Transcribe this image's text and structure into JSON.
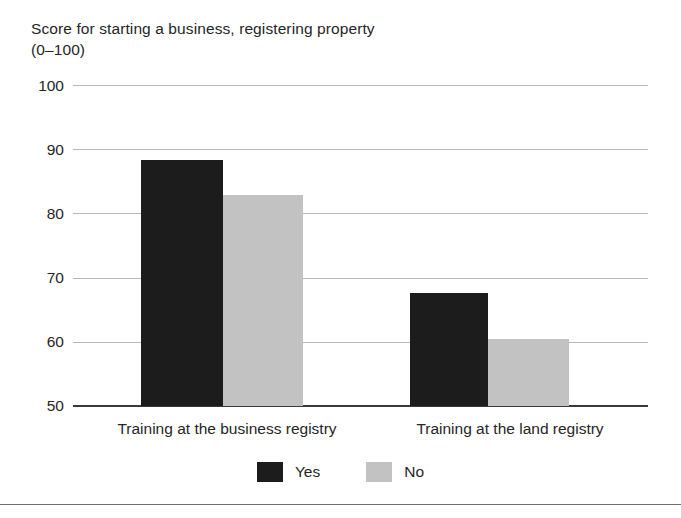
{
  "chart_data": {
    "type": "bar",
    "title_line1": "Score for starting a business, registering property",
    "title_line2": "(0–100)",
    "xlabel": "",
    "ylabel": "",
    "ylim": [
      50,
      100
    ],
    "yticks": [
      50,
      60,
      70,
      80,
      90,
      100
    ],
    "ytick_labels": [
      "50",
      "60",
      "70",
      "80",
      "90",
      "100"
    ],
    "grid": true,
    "grid_axis": "y",
    "legend_position": "bottom-center",
    "categories": [
      "Training at the business registry",
      "Training at the land registry"
    ],
    "series": [
      {
        "name": "Yes",
        "color": "#1c1c1c",
        "values": [
          88.3,
          67.6
        ]
      },
      {
        "name": "No",
        "color": "#c2c2c2",
        "values": [
          82.8,
          60.5
        ]
      }
    ]
  },
  "legend": {
    "items": [
      {
        "label": "Yes",
        "color": "#1c1c1c"
      },
      {
        "label": "No",
        "color": "#c2c2c2"
      }
    ]
  },
  "colors": {
    "yes": "#1c1c1c",
    "no": "#c2c2c2",
    "gridline": "#b9b9b9",
    "axis": "#3a3a3a",
    "text": "#262626",
    "background": "#ffffff"
  }
}
